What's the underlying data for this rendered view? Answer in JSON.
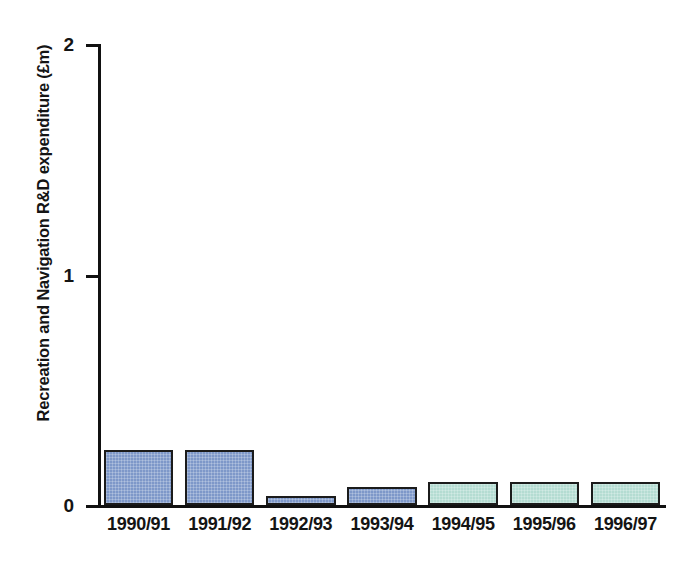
{
  "chart_data": {
    "type": "bar",
    "title": "",
    "xlabel": "",
    "ylabel": "Recreation and Navigation R&D expenditure (£m)",
    "categories": [
      "1990/91",
      "1991/92",
      "1992/93",
      "1993/94",
      "1994/95",
      "1995/96",
      "1996/97"
    ],
    "values": [
      0.24,
      0.24,
      0.04,
      0.08,
      0.1,
      0.1,
      0.1
    ],
    "ylim": [
      0,
      2
    ],
    "ytick_labels": [
      "0",
      "1",
      "2"
    ],
    "ytick_values": [
      0,
      1,
      2
    ],
    "grid": false,
    "legend": "none",
    "series": [
      {
        "name": "Recreation and Navigation R&D expenditure",
        "values": [
          0.24,
          0.24,
          0.04,
          0.08,
          0.1,
          0.1,
          0.1
        ],
        "bar_colors": [
          "blue",
          "blue",
          "blue",
          "blue",
          "green",
          "green",
          "green"
        ]
      }
    ]
  },
  "colors": {
    "bar_blue": "#7e98c9",
    "bar_green": "#b4dcd2",
    "bar_outline": "#1b1b1b",
    "axis": "#111111",
    "text": "#141414",
    "background": "#ffffff"
  }
}
